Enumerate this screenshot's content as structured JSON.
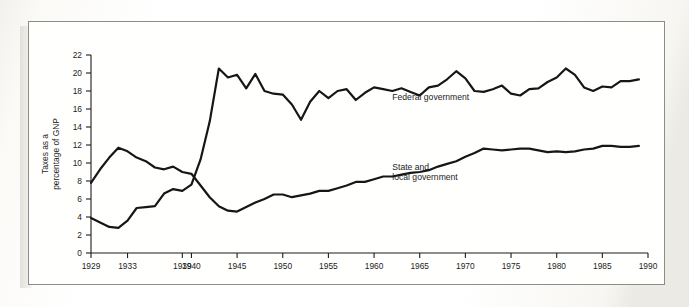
{
  "figure": {
    "background_color": "#fdfdfb",
    "frame_color": "#8d8d88",
    "line_color": "#161616"
  },
  "chart_data": {
    "type": "line",
    "title": "",
    "xlabel": "",
    "ylabel": "Taxes as a\npercentage of GNP",
    "ylabel_line1": "Taxes as a",
    "ylabel_line2": "percentage of GNP",
    "xlim": [
      1929,
      1990
    ],
    "ylim": [
      0,
      22
    ],
    "yticks": [
      0,
      2,
      4,
      6,
      8,
      10,
      12,
      14,
      16,
      18,
      20,
      22
    ],
    "ytick_labels": [
      "0",
      "2",
      "4",
      "6",
      "8",
      "10",
      "12",
      "14",
      "16",
      "18",
      "20",
      "22"
    ],
    "xticks": [
      1929,
      1933,
      1939,
      1940,
      1945,
      1950,
      1955,
      1960,
      1965,
      1970,
      1975,
      1980,
      1985,
      1990
    ],
    "xtick_labels": [
      "1929",
      "1933",
      "1939",
      "1940",
      "1945",
      "1950",
      "1955",
      "1960",
      "1965",
      "1970",
      "1975",
      "1980",
      "1985",
      "1990"
    ],
    "grid": false,
    "legend_position": "inline-annotation",
    "series": [
      {
        "name": "Federal government",
        "label_line1": "Federal government",
        "label_x": 1962,
        "label_y": 17.0,
        "x": [
          1929,
          1930,
          1931,
          1932,
          1933,
          1934,
          1935,
          1936,
          1937,
          1938,
          1939,
          1940,
          1941,
          1942,
          1943,
          1944,
          1945,
          1946,
          1947,
          1948,
          1949,
          1950,
          1951,
          1952,
          1953,
          1954,
          1955,
          1956,
          1957,
          1958,
          1959,
          1960,
          1961,
          1962,
          1963,
          1964,
          1965,
          1966,
          1967,
          1968,
          1969,
          1970,
          1971,
          1972,
          1973,
          1974,
          1975,
          1976,
          1977,
          1978,
          1979,
          1980,
          1981,
          1982,
          1983,
          1984,
          1985,
          1986,
          1987,
          1988,
          1989
        ],
        "y": [
          3.9,
          3.4,
          2.9,
          2.8,
          3.6,
          5.0,
          5.1,
          5.2,
          6.6,
          7.1,
          6.9,
          7.6,
          10.4,
          14.6,
          20.5,
          19.5,
          19.8,
          18.3,
          19.9,
          18.0,
          17.7,
          17.6,
          16.5,
          14.8,
          16.8,
          18.0,
          17.2,
          18.0,
          18.2,
          17.0,
          17.8,
          18.4,
          18.2,
          18.0,
          18.3,
          17.9,
          17.5,
          18.4,
          18.6,
          19.3,
          20.2,
          19.4,
          18.0,
          17.9,
          18.2,
          18.6,
          17.7,
          17.5,
          18.2,
          18.3,
          19.0,
          19.5,
          20.5,
          19.8,
          18.4,
          18.0,
          18.5,
          18.4,
          19.1,
          19.1,
          19.3
        ]
      },
      {
        "name": "State and local government",
        "label_line1": "State and",
        "label_line2": "local government",
        "label_x": 1962,
        "label_y": 9.2,
        "x": [
          1929,
          1930,
          1931,
          1932,
          1933,
          1934,
          1935,
          1936,
          1937,
          1938,
          1939,
          1940,
          1941,
          1942,
          1943,
          1944,
          1945,
          1946,
          1947,
          1948,
          1949,
          1950,
          1951,
          1952,
          1953,
          1954,
          1955,
          1956,
          1957,
          1958,
          1959,
          1960,
          1961,
          1962,
          1963,
          1964,
          1965,
          1966,
          1967,
          1968,
          1969,
          1970,
          1971,
          1972,
          1973,
          1974,
          1975,
          1976,
          1977,
          1978,
          1979,
          1980,
          1981,
          1982,
          1983,
          1984,
          1985,
          1986,
          1987,
          1988,
          1989
        ],
        "y": [
          7.8,
          9.3,
          10.6,
          11.7,
          11.3,
          10.6,
          10.2,
          9.5,
          9.3,
          9.6,
          9.0,
          8.8,
          7.5,
          6.2,
          5.2,
          4.7,
          4.6,
          5.1,
          5.6,
          6.0,
          6.5,
          6.5,
          6.2,
          6.4,
          6.6,
          6.9,
          6.9,
          7.2,
          7.5,
          7.9,
          7.9,
          8.2,
          8.5,
          8.5,
          8.7,
          8.9,
          9.0,
          9.2,
          9.6,
          9.9,
          10.2,
          10.7,
          11.1,
          11.6,
          11.5,
          11.4,
          11.5,
          11.6,
          11.6,
          11.4,
          11.2,
          11.3,
          11.2,
          11.3,
          11.5,
          11.6,
          11.9,
          11.9,
          11.8,
          11.8,
          11.9
        ]
      }
    ]
  }
}
